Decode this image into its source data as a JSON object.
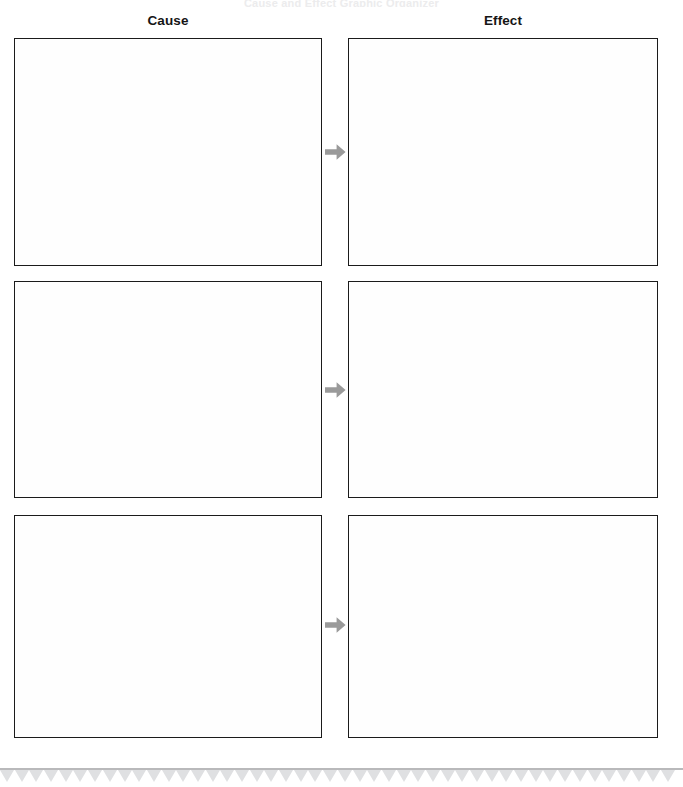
{
  "worksheet": {
    "top_clipped_text": "Cause and Effect Graphic Organizer",
    "background_color": "#ffffff",
    "box_border_color": "#1b1b1b",
    "arrow_color": "#9a9a9a",
    "footer_rule_color": "#b9b9bb",
    "footer_tooth_color": "#dfe0e2"
  },
  "columns": {
    "cause_heading": "Cause",
    "effect_heading": "Effect"
  },
  "rows": [
    {
      "index": 1,
      "cause_text": "",
      "effect_text": "",
      "arrow_icon": "arrow-right-icon"
    },
    {
      "index": 2,
      "cause_text": "",
      "effect_text": "",
      "arrow_icon": "arrow-right-icon"
    },
    {
      "index": 3,
      "cause_text": "",
      "effect_text": "",
      "arrow_icon": "arrow-right-icon"
    }
  ],
  "footer": {
    "tooth_count": 46
  }
}
